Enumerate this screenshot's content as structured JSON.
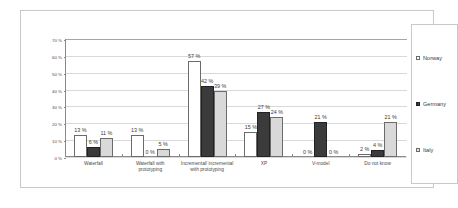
{
  "chart_data": {
    "type": "bar",
    "title": "",
    "subtitle": "",
    "xlabel": "",
    "ylabel": "",
    "ylim": [
      0,
      70
    ],
    "yticks": [
      "0 %",
      "10 %",
      "20 %",
      "30 %",
      "40 %",
      "50 %",
      "60 %",
      "70 %"
    ],
    "ytick_values": [
      0,
      10,
      20,
      30,
      40,
      50,
      60,
      70
    ],
    "grid": true,
    "legend_position": "right",
    "value_suffix": " %",
    "categories": [
      "Waterfall",
      "Waterfall with prototyping",
      "Incremental/ incremental with prototyping",
      "XP",
      "V-model",
      "Do not know"
    ],
    "series": [
      {
        "name": "Norway",
        "color": "#ffffff",
        "values": [
          13,
          13,
          57,
          15,
          0,
          2
        ],
        "labels": [
          "13 %",
          "13 %",
          "57 %",
          "15 %",
          "0 %",
          "2 %"
        ]
      },
      {
        "name": "Germany",
        "color": "#3b3b3b",
        "values": [
          6,
          0,
          42,
          27,
          21,
          4
        ],
        "labels": [
          "6 %",
          "0 %",
          "42 %",
          "27 %",
          "21 %",
          "4 %"
        ]
      },
      {
        "name": "Italy",
        "color": "#d9d9d9",
        "values": [
          11,
          5,
          39,
          24,
          0,
          21
        ],
        "labels": [
          "11 %",
          "5 %",
          "39 %",
          "24 %",
          "0 %",
          "21 %"
        ]
      }
    ]
  },
  "legend": {
    "items": [
      {
        "label": "Norway",
        "swatch": "norway"
      },
      {
        "label": "Germany",
        "swatch": "germany"
      },
      {
        "label": "Italy",
        "swatch": "italy"
      }
    ]
  }
}
